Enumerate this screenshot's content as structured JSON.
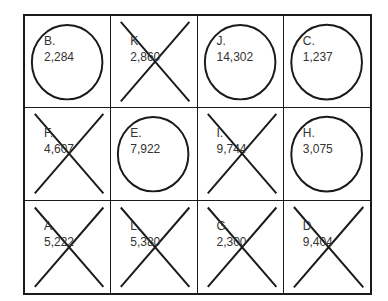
{
  "cells": [
    {
      "letter": "B.",
      "value": "2,284",
      "mark": "circle"
    },
    {
      "letter": "K.",
      "value": "2,860",
      "mark": "x"
    },
    {
      "letter": "J.",
      "value": "14,302",
      "mark": "circle"
    },
    {
      "letter": "C.",
      "value": "1,237",
      "mark": "circle"
    },
    {
      "letter": "F.",
      "value": "4,607",
      "mark": "x"
    },
    {
      "letter": "E.",
      "value": "7,922",
      "mark": "circle"
    },
    {
      "letter": "I.",
      "value": "9,744",
      "mark": "x"
    },
    {
      "letter": "H.",
      "value": "3,075",
      "mark": "circle"
    },
    {
      "letter": "A.",
      "value": "5,222",
      "mark": "x"
    },
    {
      "letter": "L.",
      "value": "5,380",
      "mark": "x"
    },
    {
      "letter": "G.",
      "value": "2,300",
      "mark": "x"
    },
    {
      "letter": "D.",
      "value": "9,404",
      "mark": "x"
    }
  ]
}
